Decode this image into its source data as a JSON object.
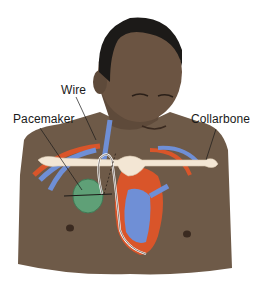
{
  "labels": {
    "wire": "Wire",
    "pacemaker": "Pacemaker",
    "collarbone": "Collarbone"
  },
  "colors": {
    "skin": "#6e5a48",
    "skin_shadow": "#5a4838",
    "hair": "#1c1a18",
    "bone": "#f3e6d4",
    "artery": "#d9552a",
    "vein": "#6f8fd6",
    "pacemaker": "#5fa077",
    "wire": "#ffffff"
  }
}
